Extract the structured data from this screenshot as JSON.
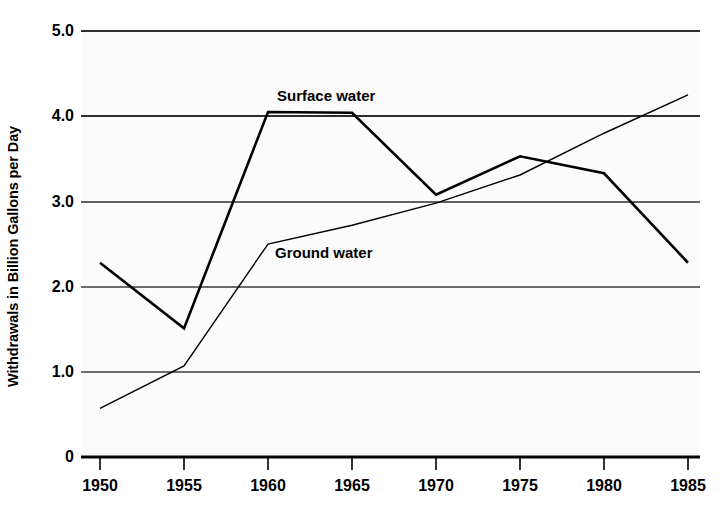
{
  "chart_data": {
    "type": "line",
    "title": "",
    "xlabel": "",
    "ylabel": "Withdrawals in Billion Gallons per Day",
    "x": [
      1950,
      1955,
      1960,
      1965,
      1970,
      1975,
      1980,
      1985
    ],
    "xticklabels": [
      "1950",
      "1955",
      "1960",
      "1965",
      "1970",
      "1975",
      "1980",
      "1985"
    ],
    "yticklabels": [
      "5.0",
      "4.0",
      "3.0",
      "2.0",
      "1.0",
      "0"
    ],
    "yticks": [
      5.0,
      4.0,
      3.0,
      2.0,
      1.0,
      0
    ],
    "xlim": [
      1950,
      1985
    ],
    "ylim": [
      0,
      5.0
    ],
    "grid": true,
    "legend_position": "inline-annotation",
    "series": [
      {
        "name": "Surface water",
        "values": [
          2.28,
          1.51,
          4.05,
          4.04,
          3.08,
          3.53,
          3.33,
          2.28
        ],
        "color": "#000000",
        "linewidth": 2.6,
        "label_x": 1960,
        "label_y": 4.35
      },
      {
        "name": "Ground water",
        "values": [
          0.57,
          1.07,
          2.5,
          2.72,
          2.98,
          3.31,
          3.8,
          4.25
        ],
        "color": "#000000",
        "linewidth": 1.4,
        "label_x": 1960,
        "label_y": 2.52
      }
    ]
  },
  "annotations": {
    "surface_water_label": "Surface water",
    "ground_water_label": "Ground water"
  },
  "axis": {
    "y_title": "Withdrawals in Billion Gallons per Day",
    "y_labels": [
      "5.0",
      "4.0",
      "3.0",
      "2.0",
      "1.0",
      "0"
    ],
    "x_labels": [
      "1950",
      "1955",
      "1960",
      "1965",
      "1970",
      "1975",
      "1980",
      "1985"
    ]
  },
  "colors": {
    "axis": "#000000",
    "gridline": "#3c3c3c",
    "plot_background": "#fbfbfb",
    "page_background": "#ffffff"
  }
}
